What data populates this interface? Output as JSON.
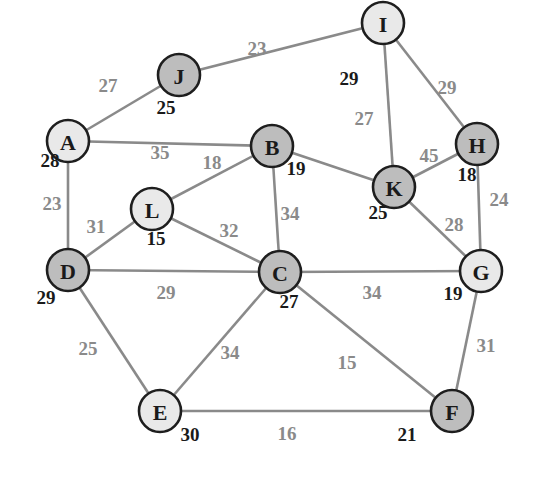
{
  "diagram": {
    "type": "weighted-undirected-graph",
    "colors": {
      "edge": "#8a8a8a",
      "node_stroke": "#1e1e1e",
      "node_fill_light": "#e9e9e9",
      "node_fill_dark": "#bdbdbd",
      "node_text": "#1a1a1a",
      "weight_text": "#8a8a8a",
      "value_text": "#1a1a1a"
    },
    "node_radius": 21,
    "nodes": [
      {
        "id": "A",
        "label": "A",
        "x": 68,
        "y": 141,
        "fill": "light",
        "value": "28",
        "vx": 50,
        "vy": 160
      },
      {
        "id": "B",
        "label": "B",
        "x": 272,
        "y": 146,
        "fill": "dark",
        "value": "19",
        "vx": 296,
        "vy": 168
      },
      {
        "id": "C",
        "label": "C",
        "x": 280,
        "y": 272,
        "fill": "dark",
        "value": "27",
        "vx": 289,
        "vy": 301
      },
      {
        "id": "D",
        "label": "D",
        "x": 68,
        "y": 270,
        "fill": "dark",
        "value": "29",
        "vx": 46,
        "vy": 297
      },
      {
        "id": "E",
        "label": "E",
        "x": 160,
        "y": 411,
        "fill": "light",
        "value": "30",
        "vx": 190,
        "vy": 434
      },
      {
        "id": "F",
        "label": "F",
        "x": 452,
        "y": 411,
        "fill": "dark",
        "value": "21",
        "vx": 407,
        "vy": 434
      },
      {
        "id": "G",
        "label": "G",
        "x": 481,
        "y": 271,
        "fill": "light",
        "value": "19",
        "vx": 453,
        "vy": 293
      },
      {
        "id": "H",
        "label": "H",
        "x": 477,
        "y": 144,
        "fill": "dark",
        "value": "18",
        "vx": 467,
        "vy": 174
      },
      {
        "id": "I",
        "label": "I",
        "x": 383,
        "y": 23,
        "fill": "light",
        "value": "29",
        "vx": 349,
        "vy": 78
      },
      {
        "id": "J",
        "label": "J",
        "x": 179,
        "y": 75,
        "fill": "dark",
        "value": "25",
        "vx": 166,
        "vy": 107
      },
      {
        "id": "K",
        "label": "K",
        "x": 394,
        "y": 187,
        "fill": "dark",
        "value": "25",
        "vx": 378,
        "vy": 212
      },
      {
        "id": "L",
        "label": "L",
        "x": 152,
        "y": 209,
        "fill": "light",
        "value": "15",
        "vx": 156,
        "vy": 238
      }
    ],
    "edges": [
      {
        "from": "A",
        "to": "J",
        "weight": "27",
        "lx": 108,
        "ly": 85
      },
      {
        "from": "J",
        "to": "I",
        "weight": "23",
        "lx": 257,
        "ly": 48
      },
      {
        "from": "A",
        "to": "B",
        "weight": "35",
        "lx": 160,
        "ly": 152
      },
      {
        "from": "A",
        "to": "D",
        "weight": "23",
        "lx": 52,
        "ly": 203
      },
      {
        "from": "I",
        "to": "K",
        "weight": "27",
        "lx": 364,
        "ly": 118
      },
      {
        "from": "I",
        "to": "H",
        "weight": "29",
        "lx": 447,
        "ly": 87
      },
      {
        "from": "B",
        "to": "L",
        "weight": "18",
        "lx": 212,
        "ly": 162
      },
      {
        "from": "B",
        "to": "K",
        "weight": "",
        "lx": 0,
        "ly": 0
      },
      {
        "from": "K",
        "to": "H",
        "weight": "45",
        "lx": 429,
        "ly": 155
      },
      {
        "from": "B",
        "to": "C",
        "weight": "34",
        "lx": 290,
        "ly": 213
      },
      {
        "from": "L",
        "to": "D",
        "weight": "31",
        "lx": 96,
        "ly": 226
      },
      {
        "from": "L",
        "to": "C",
        "weight": "32",
        "lx": 229,
        "ly": 230
      },
      {
        "from": "K",
        "to": "G",
        "weight": "28",
        "lx": 454,
        "ly": 224
      },
      {
        "from": "H",
        "to": "G",
        "weight": "24",
        "lx": 499,
        "ly": 199
      },
      {
        "from": "D",
        "to": "C",
        "weight": "29",
        "lx": 166,
        "ly": 292
      },
      {
        "from": "C",
        "to": "G",
        "weight": "34",
        "lx": 372,
        "ly": 292
      },
      {
        "from": "D",
        "to": "E",
        "weight": "25",
        "lx": 88,
        "ly": 348
      },
      {
        "from": "C",
        "to": "E",
        "weight": "34",
        "lx": 230,
        "ly": 352
      },
      {
        "from": "C",
        "to": "F",
        "weight": "15",
        "lx": 347,
        "ly": 362
      },
      {
        "from": "G",
        "to": "F",
        "weight": "31",
        "lx": 486,
        "ly": 345
      },
      {
        "from": "E",
        "to": "F",
        "weight": "16",
        "lx": 287,
        "ly": 433
      }
    ]
  }
}
